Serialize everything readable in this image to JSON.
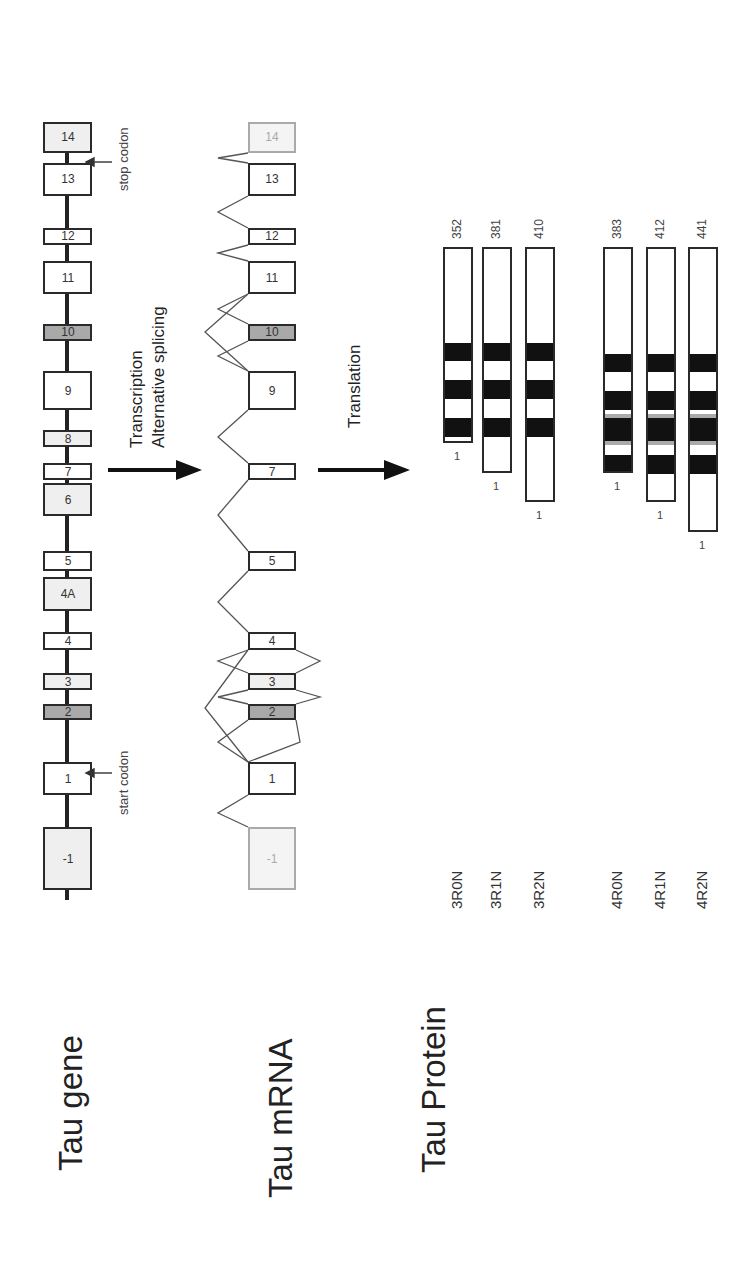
{
  "rows": {
    "gene": "Tau gene",
    "mrna": "Tau mRNA",
    "protein": "Tau Protein"
  },
  "gene": {
    "exons": [
      {
        "label": "-1",
        "x": 373,
        "w": 63,
        "fill": "light"
      },
      {
        "label": "1",
        "x": 468,
        "w": 33,
        "fill": "white"
      },
      {
        "label": "2",
        "x": 543,
        "w": 16,
        "fill": "dark"
      },
      {
        "label": "3",
        "x": 573,
        "w": 17,
        "fill": "light"
      },
      {
        "label": "4",
        "x": 613,
        "w": 18,
        "fill": "white"
      },
      {
        "label": "4A",
        "x": 652,
        "w": 34,
        "fill": "light"
      },
      {
        "label": "5",
        "x": 692,
        "w": 20,
        "fill": "white"
      },
      {
        "label": "6",
        "x": 747,
        "w": 33,
        "fill": "light"
      },
      {
        "label": "7",
        "x": 783,
        "w": 17,
        "fill": "white"
      },
      {
        "label": "8",
        "x": 816,
        "w": 17,
        "fill": "light"
      },
      {
        "label": "9",
        "x": 853,
        "w": 39,
        "fill": "white"
      },
      {
        "label": "10",
        "x": 922,
        "w": 17,
        "fill": "dark"
      },
      {
        "label": "11",
        "x": 969,
        "w": 33,
        "fill": "white"
      },
      {
        "label": "12",
        "x": 1018,
        "w": 17,
        "fill": "white"
      },
      {
        "label": "13",
        "x": 1067,
        "w": 33,
        "fill": "white"
      },
      {
        "label": "14",
        "x": 1110,
        "w": 31,
        "fill": "light"
      }
    ],
    "start_codon": "start codon",
    "stop_codon": "stop codon"
  },
  "steps": {
    "transcription": "Transcription",
    "splicing": "Alternative splicing",
    "translation": "Translation"
  },
  "mrna": {
    "exons": [
      {
        "label": "-1",
        "x": 373,
        "w": 63,
        "fill": "faint"
      },
      {
        "label": "1",
        "x": 468,
        "w": 33,
        "fill": "white"
      },
      {
        "label": "2",
        "x": 543,
        "w": 16,
        "fill": "dark"
      },
      {
        "label": "3",
        "x": 573,
        "w": 17,
        "fill": "light"
      },
      {
        "label": "4",
        "x": 613,
        "w": 18,
        "fill": "white"
      },
      {
        "label": "5",
        "x": 692,
        "w": 20,
        "fill": "white"
      },
      {
        "label": "7",
        "x": 783,
        "w": 17,
        "fill": "white"
      },
      {
        "label": "9",
        "x": 853,
        "w": 39,
        "fill": "white"
      },
      {
        "label": "10",
        "x": 922,
        "w": 17,
        "fill": "dark"
      },
      {
        "label": "11",
        "x": 969,
        "w": 33,
        "fill": "white"
      },
      {
        "label": "12",
        "x": 1018,
        "w": 17,
        "fill": "white"
      },
      {
        "label": "13",
        "x": 1067,
        "w": 33,
        "fill": "white"
      },
      {
        "label": "14",
        "x": 1110,
        "w": 31,
        "fill": "faint"
      }
    ]
  },
  "protein": {
    "colors": {
      "repeat": "#111111",
      "insert_dark": "#a9a9a9",
      "insert_light": "#efefef",
      "r2_edge": "#aaaaaa"
    },
    "isoforms": [
      {
        "name": "3R0N",
        "length": "352",
        "start_label": "1",
        "repeats": 3,
        "n_inserts": 0
      },
      {
        "name": "3R1N",
        "length": "381",
        "start_label": "1",
        "repeats": 3,
        "n_inserts": 1
      },
      {
        "name": "3R2N",
        "length": "410",
        "start_label": "1",
        "repeats": 3,
        "n_inserts": 2
      },
      {
        "name": "4R0N",
        "length": "383",
        "start_label": "1",
        "repeats": 4,
        "n_inserts": 0
      },
      {
        "name": "4R1N",
        "length": "412",
        "start_label": "1",
        "repeats": 4,
        "n_inserts": 1
      },
      {
        "name": "4R2N",
        "length": "441",
        "start_label": "1",
        "repeats": 4,
        "n_inserts": 2
      }
    ]
  }
}
